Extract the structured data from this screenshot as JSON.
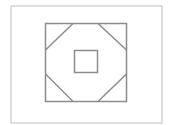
{
  "diagram": {
    "stroke_color": "#8c8c8c",
    "outer_border_color": "#c8c8c8",
    "frame": {
      "x": 11,
      "y": 6,
      "w": 151,
      "h": 117
    },
    "outer_square": {
      "x": 45.5,
      "y": 23.5,
      "w": 81,
      "h": 78
    },
    "center_square": {
      "x": 74.5,
      "y": 50.5,
      "w": 23,
      "h": 22
    },
    "diagonals": [
      {
        "name": "top-left",
        "x1": 73,
        "y1": 23.5,
        "x2": 45.5,
        "y2": 50
      },
      {
        "name": "top-right",
        "x1": 98,
        "y1": 23.5,
        "x2": 126.5,
        "y2": 50
      },
      {
        "name": "bottom-left",
        "x1": 45.5,
        "y1": 74,
        "x2": 73,
        "y2": 101.5
      },
      {
        "name": "bottom-right",
        "x1": 98,
        "y1": 101.5,
        "x2": 126.5,
        "y2": 74
      }
    ]
  }
}
